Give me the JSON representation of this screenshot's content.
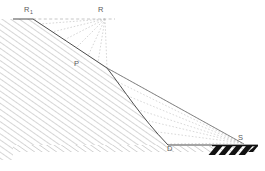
{
  "figure": {
    "type": "engineering-line-diagram",
    "canvas": {
      "width": 265,
      "height": 171
    },
    "colors": {
      "outline": "#4a4a4a",
      "hatch": "#9a9a9a",
      "dashed": "#b4b4b4",
      "fan": "#c2c2c2",
      "label": "#5a5a5a",
      "ground_bar": "#111111",
      "background": "#ffffff"
    }
  },
  "labels": {
    "r1": {
      "text": "R",
      "sub": "1",
      "name": "point-R1"
    },
    "r": {
      "text": "R",
      "name": "point-R"
    },
    "p": {
      "text": "P",
      "name": "point-P"
    },
    "d": {
      "text": "D",
      "name": "point-D"
    },
    "s": {
      "text": "S",
      "name": "point-S"
    }
  },
  "geometry": {
    "points": {
      "R1": [
        33,
        19
      ],
      "R": [
        105,
        19
      ],
      "P": [
        107,
        68
      ],
      "D": [
        168,
        145
      ],
      "S": [
        242,
        144
      ],
      "crest_left": [
        13,
        19
      ],
      "ground_right": [
        258,
        145
      ],
      "base_left": [
        13,
        171
      ]
    },
    "slope_face": "R1 to P straight, P to D log-spiral curve",
    "ground_surface": "D to S horizontal",
    "crest_surface": "R1 to R dashed horizontal",
    "chord": "P to S straight solid",
    "upper_fan_apex": "R",
    "lower_fan_apex": "S",
    "upper_fan_rays": 7,
    "lower_fan_rays": 7,
    "hatch_angle_deg": 55,
    "ground_bar": {
      "x_start": 214,
      "x_end": 258,
      "y": 147,
      "stripes": 5
    }
  }
}
